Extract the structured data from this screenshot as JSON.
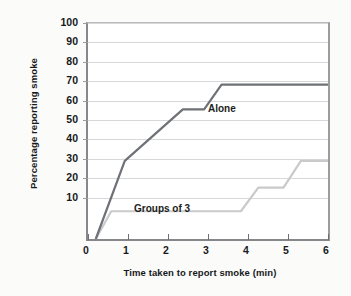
{
  "chart_data": {
    "type": "line",
    "title": "",
    "xlabel": "Time taken to report smoke (min)",
    "ylabel": "Percentage reporting smoke",
    "xlim": [
      0,
      6.2
    ],
    "ylim": [
      0,
      105
    ],
    "xticks": [
      0,
      1,
      2,
      3,
      4,
      5,
      6
    ],
    "xtick_labels": [
      "0",
      "1",
      "2",
      "3",
      "4",
      "5",
      "6"
    ],
    "yticks": [
      10,
      20,
      30,
      40,
      50,
      60,
      70,
      80,
      90,
      100
    ],
    "ytick_labels": [
      "10",
      "20",
      "30",
      "40",
      "50",
      "60",
      "70",
      "80",
      "90",
      "100"
    ],
    "grid": true,
    "grid_axis": "y",
    "legend_position": "inline-annotations",
    "series": [
      {
        "name": "Alone",
        "color": "#6e7175",
        "label_text": "Alone",
        "x": [
          0.2,
          0.95,
          2.45,
          3.0,
          3.45,
          6.2
        ],
        "values": [
          0,
          38,
          63,
          63,
          75,
          75
        ]
      },
      {
        "name": "Groups of 3",
        "color": "#c9cacc",
        "label_text": "Groups of 3",
        "x": [
          0.2,
          0.6,
          3.95,
          4.4,
          5.05,
          5.5,
          6.2
        ],
        "values": [
          0,
          13.5,
          13.5,
          25,
          25,
          38,
          38
        ]
      }
    ],
    "annotations": [
      {
        "text": "Alone",
        "x": 3.6,
        "y": 68
      },
      {
        "text": "Groups of 3",
        "x": 1.45,
        "y": 18
      }
    ]
  }
}
